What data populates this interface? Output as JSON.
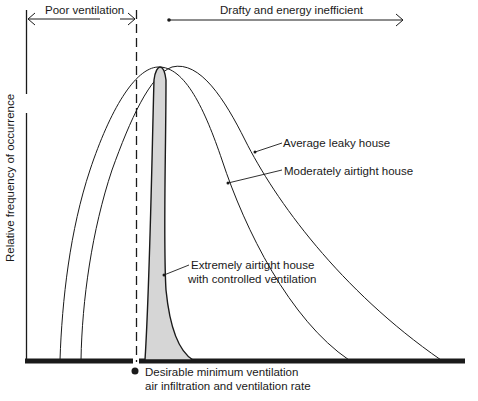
{
  "diagram": {
    "top_labels": {
      "poor_ventilation": "Poor ventilation",
      "drafty": "Drafty and energy inefficient"
    },
    "y_axis_label": "Relative frequency of occurrence",
    "curve_labels": {
      "average_leaky": "Average leaky house",
      "moderately_airtight": "Moderately airtight house",
      "extremely_airtight_line1": "Extremely airtight house",
      "extremely_airtight_line2": "with controlled ventilation"
    },
    "threshold_label": {
      "line1": "Desirable minimum ventilation",
      "line2": "air infiltration and ventilation rate"
    },
    "colors": {
      "line": "#1a1a1a",
      "spike_fill": "#d6d6d6",
      "background": "#ffffff"
    }
  }
}
